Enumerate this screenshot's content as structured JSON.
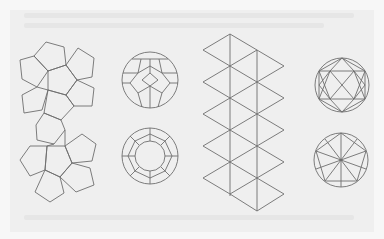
{
  "figure": {
    "background": "#f7f7f7",
    "page_tint": "#efefef",
    "stroke_color": "#6e6e6e",
    "items": [
      {
        "name": "dodecahedron-net",
        "description": "Two rosettes of 6 pentagons joined"
      },
      {
        "name": "dodecahedron-circle-top",
        "description": "Dodecahedron inscribed in circle, vertex-up view"
      },
      {
        "name": "dodecahedron-circle-bottom",
        "description": "Dodecahedron inscribed in circle, face-on view"
      },
      {
        "name": "icosahedron-net",
        "description": "Strip of 20 equilateral triangles"
      },
      {
        "name": "icosahedron-circle-top",
        "description": "Icosahedron inscribed in circle, edge view"
      },
      {
        "name": "icosahedron-circle-bottom",
        "description": "Icosahedron inscribed in circle, vertex view"
      }
    ]
  }
}
